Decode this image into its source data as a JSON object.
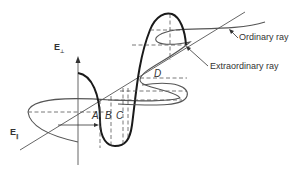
{
  "diagram": {
    "type": "birefringence-wave-diagram",
    "axes": {
      "e_perp": {
        "label": "E",
        "subscript": "⊥"
      },
      "e_par": {
        "label": "E",
        "subscript": "∥"
      }
    },
    "segments": {
      "a": "A",
      "b": "B",
      "c": "C",
      "d": "D"
    },
    "callouts": {
      "ordinary": "Ordinary ray",
      "extraordinary": "Extraordinary ray"
    },
    "colors": {
      "line": "#555555",
      "heavy": "#1a1a1a",
      "text": "#333333"
    }
  }
}
